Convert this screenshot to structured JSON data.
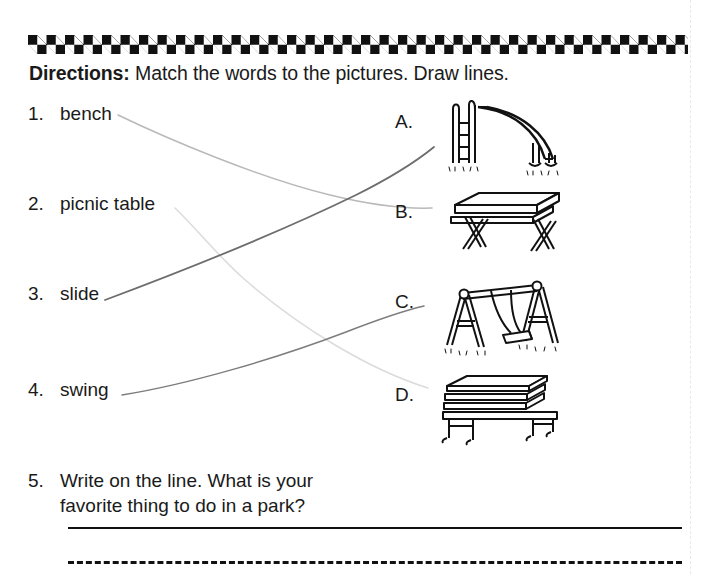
{
  "worksheet": {
    "directions_label": "Directions:",
    "directions_text": "Match the words to the pictures. Draw lines.",
    "words": [
      {
        "num": "1.",
        "label": "bench"
      },
      {
        "num": "2.",
        "label": "picnic table"
      },
      {
        "num": "3.",
        "label": "slide"
      },
      {
        "num": "4.",
        "label": "swing"
      }
    ],
    "pictures": [
      {
        "letter": "A.",
        "icon": "slide-icon",
        "alt": "playground slide with ladder"
      },
      {
        "letter": "B.",
        "icon": "picnic-table-icon",
        "alt": "picnic table"
      },
      {
        "letter": "C.",
        "icon": "swing-icon",
        "alt": "swing set"
      },
      {
        "letter": "D.",
        "icon": "park-bench-icon",
        "alt": "park bench"
      }
    ],
    "drawn_connections": [
      {
        "from": "1",
        "to": "B",
        "color": "#b9b9b9"
      },
      {
        "from": "2",
        "to": "D",
        "color": "#dcdcdc"
      },
      {
        "from": "3",
        "to": "A",
        "color": "#6d6d6d"
      },
      {
        "from": "4",
        "to": "C",
        "color": "#7d7d7d"
      }
    ],
    "question5": {
      "num": "5.",
      "line1": "Write on the line. What is your",
      "line2": "favorite thing to do in a park?"
    }
  },
  "colors": {
    "ink": "#111111",
    "paper": "#ffffff",
    "pencil_light": "#dcdcdc",
    "pencil_dark": "#6d6d6d",
    "fold": "#e8e8e8"
  }
}
